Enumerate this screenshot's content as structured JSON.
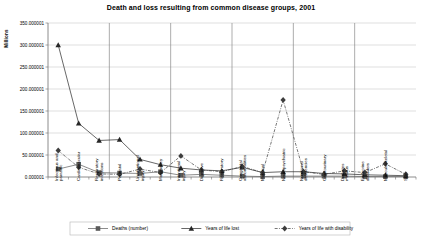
{
  "chart_data": {
    "type": "line",
    "title": "Death and loss resulting from common disease groups, 2001",
    "xlabel": "",
    "ylabel": "Millions",
    "ylim": [
      1e-06,
      350.000001
    ],
    "ytick_labels": [
      "0.000001",
      "50.000001",
      "100.000001",
      "150.000001",
      "200.000001",
      "250.000001",
      "300.000001",
      "350.000001"
    ],
    "ytick_values": [
      0,
      50,
      100,
      150,
      200,
      250,
      300,
      350
    ],
    "grid": true,
    "legend_position": "bottom",
    "categories": [
      "Infectious and parasitic",
      "Cardiovascular",
      "Respiratory infections",
      "Perinatal",
      "Unintentional injury",
      "Malignancy",
      "Intentional injury",
      "Digestive",
      "Respiratory",
      "Congenital abnormalities",
      "Maternal",
      "Neuropsychiatric",
      "Nutritional deficiencies",
      "Genitourinary",
      "Diabetes mellitus",
      "Endocrine disorders",
      "Musculoskeletal",
      "Skin"
    ],
    "series": [
      {
        "name": "Deaths (number)",
        "marker": "square",
        "color": "#5a5a5a",
        "dash": "none",
        "values": [
          18,
          29,
          10,
          9,
          8,
          12,
          4,
          6,
          4,
          2,
          1,
          2,
          2,
          2,
          2,
          1,
          1,
          1
        ]
      },
      {
        "name": "Years of life lost",
        "marker": "triangle",
        "color": "#262626",
        "dash": "none",
        "values": [
          300,
          122,
          83,
          85,
          40,
          28,
          20,
          16,
          14,
          22,
          10,
          12,
          12,
          8,
          7,
          5,
          4,
          3
        ]
      },
      {
        "name": "Years of life with disability",
        "marker": "diamond",
        "color": "#3d3d3d",
        "dash": "dashdot",
        "values": [
          60,
          22,
          7,
          6,
          18,
          10,
          48,
          16,
          12,
          24,
          10,
          175,
          12,
          6,
          14,
          10,
          30,
          6
        ]
      }
    ]
  }
}
